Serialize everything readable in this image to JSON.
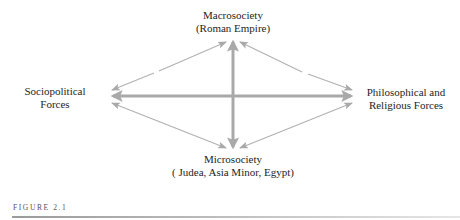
{
  "diagram": {
    "nodes": {
      "top": {
        "line1": "Macrosociety",
        "line2": "(Roman Empire)"
      },
      "left": {
        "line1": "Sociopolitical",
        "line2": "Forces"
      },
      "right": {
        "line1": "Philosophical and",
        "line2": "Religious Forces"
      },
      "bottom": {
        "line1": "Microsociety",
        "line2": "( Judea, Asia Minor, Egypt)"
      }
    },
    "connections": [
      {
        "from": "top",
        "to": "bottom",
        "style": "thick",
        "direction": "bidirectional"
      },
      {
        "from": "left",
        "to": "right",
        "style": "thick",
        "direction": "bidirectional"
      },
      {
        "from": "top",
        "to": "left",
        "style": "thin",
        "direction": "bidirectional"
      },
      {
        "from": "top",
        "to": "right",
        "style": "thin",
        "direction": "bidirectional"
      },
      {
        "from": "left",
        "to": "bottom",
        "style": "thin",
        "direction": "bidirectional"
      },
      {
        "from": "right",
        "to": "bottom",
        "style": "thin",
        "direction": "bidirectional"
      }
    ],
    "colors": {
      "arrow": "#a9a9a9",
      "text": "#1e1e1e"
    }
  },
  "caption": {
    "label": "FIGURE 2.1"
  }
}
